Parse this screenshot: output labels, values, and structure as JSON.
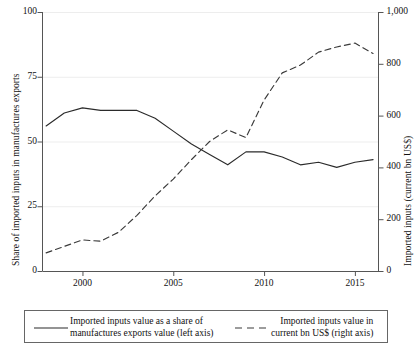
{
  "chart_data": {
    "type": "line",
    "title": "",
    "xlabel": "",
    "ylabel": "Share of imported inputs in manufactures exports",
    "ylabel_right": "Imported inputs (current bn US$)",
    "x": [
      1998,
      1999,
      2000,
      2001,
      2002,
      2003,
      2004,
      2005,
      2006,
      2007,
      2008,
      2009,
      2010,
      2011,
      2012,
      2013,
      2014,
      2015,
      2016
    ],
    "xlim": [
      1997.8,
      2016.3
    ],
    "xticks": [
      2000,
      2005,
      2010,
      2015
    ],
    "xticklabels": [
      "2000",
      "2005",
      "2010",
      "2015"
    ],
    "ylim": [
      0,
      100
    ],
    "yticks": [
      0,
      25,
      50,
      75,
      100
    ],
    "yticklabels": [
      "0",
      "25",
      "50",
      "75",
      "100"
    ],
    "ylim_right": [
      0,
      1000
    ],
    "yticks_right": [
      0,
      200,
      400,
      600,
      800,
      1000
    ],
    "yticklabels_right": [
      "0",
      "200",
      "400",
      "600",
      "800",
      "1,000"
    ],
    "grid": "horizontal-left-axis",
    "legend_position": "below-plot",
    "series": [
      {
        "name": "Imported inputs value as a share of manufactures exports value (left axis)",
        "axis": "left",
        "style": "solid",
        "color": "#2b2b2b",
        "values": [
          56,
          61,
          63,
          62,
          62,
          62,
          59,
          54,
          49,
          45,
          41,
          46,
          46,
          44,
          41,
          42,
          40,
          42,
          43
        ]
      },
      {
        "name": "Imported inputs value in current bn US$ (right axis)",
        "axis": "right",
        "style": "dashed",
        "color": "#3a3a3a",
        "values": [
          70,
          95,
          120,
          115,
          150,
          215,
          290,
          355,
          430,
          500,
          545,
          515,
          660,
          765,
          795,
          845,
          865,
          880,
          840
        ]
      }
    ]
  },
  "axes": {
    "left_title": "Share of imported inputs in manufactures exports",
    "right_title": "Imported inputs (current bn US$)"
  },
  "legend": {
    "share": {
      "label": "Imported inputs value as a share of\nmanufactures exports value (left axis)",
      "key": "solid-line-key"
    },
    "value": {
      "label": "Imported inputs value in\ncurrent bn US$ (right axis)",
      "key": "dashed-line-key"
    }
  },
  "colors": {
    "line_solid": "#2b2b2b",
    "line_dashed": "#3a3a3a",
    "axis": "#555555",
    "grid": "#ededed",
    "text": "#111111",
    "legend_border": "#666666",
    "background": "#ffffff"
  }
}
